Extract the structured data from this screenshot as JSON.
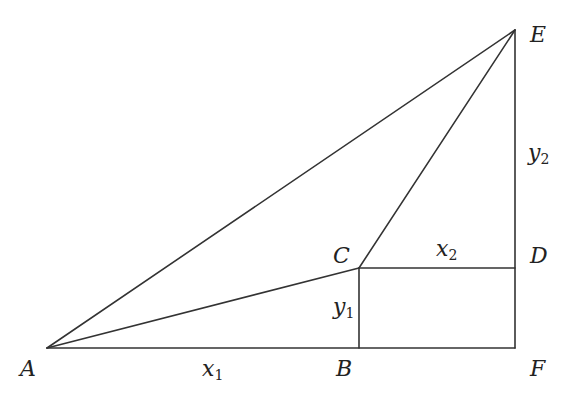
{
  "diagram": {
    "points": {
      "A": {
        "label": "A",
        "x": 47,
        "y": 348
      },
      "B": {
        "label": "B",
        "x": 359,
        "y": 348
      },
      "C": {
        "label": "C",
        "x": 359,
        "y": 268
      },
      "D": {
        "label": "D",
        "x": 515,
        "y": 268
      },
      "E": {
        "label": "E",
        "x": 515,
        "y": 30
      },
      "F": {
        "label": "F",
        "x": 515,
        "y": 348
      }
    },
    "segments": [
      [
        "A",
        "E"
      ],
      [
        "A",
        "C"
      ],
      [
        "A",
        "F"
      ],
      [
        "C",
        "E"
      ],
      [
        "C",
        "D"
      ],
      [
        "C",
        "B"
      ],
      [
        "E",
        "F"
      ]
    ],
    "measures": {
      "x1": {
        "var": "x",
        "sub": "1"
      },
      "x2": {
        "var": "x",
        "sub": "2"
      },
      "y1": {
        "var": "y",
        "sub": "1"
      },
      "y2": {
        "var": "y",
        "sub": "2"
      }
    },
    "stroke_color": "#333333"
  }
}
